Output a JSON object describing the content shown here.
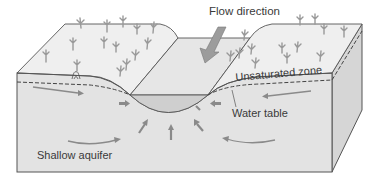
{
  "diagram": {
    "labels": {
      "flow_direction": "Flow direction",
      "unsaturated_zone": "Unsaturated zone",
      "water_table": "Water table",
      "shallow_aquifer": "Shallow aquifer"
    },
    "icons": [
      "flow-direction-arrow-icon",
      "groundwater-flow-arrow-icon",
      "grass-tuft-icon",
      "spring-seep-icon"
    ],
    "colors": {
      "background": "#ffffff",
      "top_surface": "#ededed",
      "front_face": "#e2e2e2",
      "side_face": "#d6d6d6",
      "stream_water": "#cfcfcf",
      "outline": "#555555",
      "arrows": "#8a8a8a",
      "grass": "#9a9a9a",
      "text": "#3a3a3a"
    }
  }
}
